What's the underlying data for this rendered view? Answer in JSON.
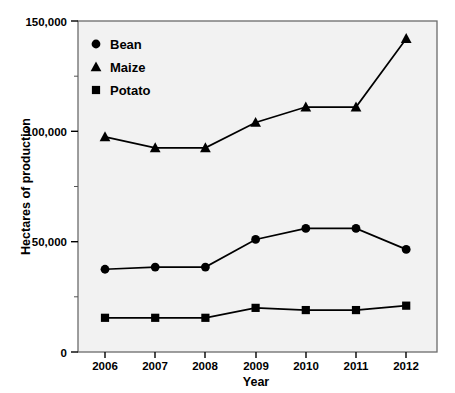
{
  "chart_data": {
    "type": "line",
    "title": "",
    "xlabel": "Year",
    "ylabel": "Hectares of production",
    "categories": [
      "2006",
      "2007",
      "2008",
      "2009",
      "2010",
      "2011",
      "2012"
    ],
    "x": [
      2006,
      2007,
      2008,
      2009,
      2010,
      2011,
      2012
    ],
    "series": [
      {
        "name": "Bean",
        "marker": "circle",
        "values": [
          37500,
          38500,
          38500,
          51000,
          56000,
          56000,
          46500
        ]
      },
      {
        "name": "Maize",
        "marker": "triangle",
        "values": [
          97500,
          92500,
          92500,
          104000,
          111000,
          111000,
          142000
        ]
      },
      {
        "name": "Potato",
        "marker": "square",
        "values": [
          15500,
          15500,
          15500,
          20000,
          19000,
          19000,
          21000
        ]
      }
    ],
    "ylim": [
      0,
      150000
    ],
    "xlim": [
      2005.5,
      2012.7
    ],
    "ytick_values": [
      0,
      50000,
      100000,
      150000
    ],
    "ytick_labels": [
      "0",
      "50,000",
      "100,000",
      "150,000"
    ],
    "yminor_tick_values": [
      25000,
      75000,
      125000
    ],
    "xtick_labels": [
      "2006",
      "2007",
      "2008",
      "2009",
      "2010",
      "2011",
      "2012"
    ],
    "grid": false,
    "legend_position": "top-left",
    "legend_entries": [
      "Bean",
      "Maize",
      "Potato"
    ],
    "colors": {
      "line": "#000000",
      "marker": "#000000",
      "plot_background": "#f2f2f2",
      "plot_border": "#6b6b6b",
      "text": "#000000"
    }
  },
  "legend": {
    "items": [
      {
        "label": "Bean",
        "marker": "circle"
      },
      {
        "label": "Maize",
        "marker": "triangle"
      },
      {
        "label": "Potato",
        "marker": "square"
      }
    ]
  },
  "axes": {
    "y_title": "Hectares of production",
    "x_title": "Year",
    "y_labels": [
      "150,000",
      "100,000",
      "50,000",
      "0"
    ],
    "x_labels": [
      "2006",
      "2007",
      "2008",
      "2009",
      "2010",
      "2011",
      "2012"
    ]
  }
}
